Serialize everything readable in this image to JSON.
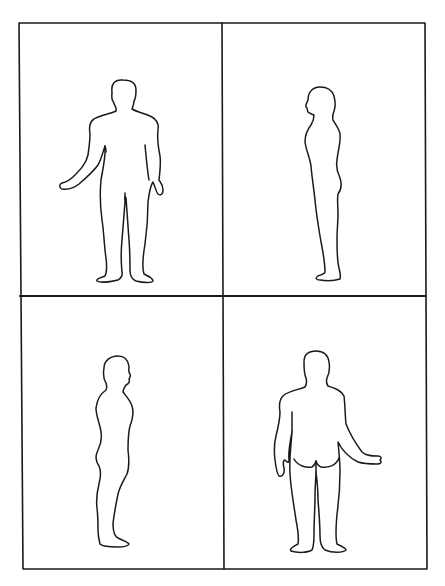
{
  "page": {
    "background": "#ffffff",
    "line_color": "#1a1a1a",
    "top_cropped_text": ""
  },
  "diagram": {
    "type": "body-outline-chart",
    "layout": "2x2 grid",
    "panels": [
      {
        "position": "top-left",
        "view": "anterior (front)",
        "label": ""
      },
      {
        "position": "top-right",
        "view": "left lateral (side, facing left)",
        "label": ""
      },
      {
        "position": "bottom-left",
        "view": "right lateral (side, facing right)",
        "label": ""
      },
      {
        "position": "bottom-right",
        "view": "posterior (back)",
        "label": ""
      }
    ]
  }
}
